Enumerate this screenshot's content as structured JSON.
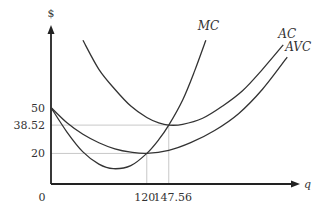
{
  "chart_data": {
    "type": "line",
    "title": "",
    "xlabel": "q",
    "ylabel": "$",
    "xlim": [
      0,
      312
    ],
    "ylim": [
      0,
      104
    ],
    "grid": false,
    "origin_label": "0",
    "x_ticks": [
      {
        "value": 120,
        "label": "120"
      },
      {
        "value": 147.56,
        "label": "147.56"
      }
    ],
    "y_ticks": [
      {
        "value": 50,
        "label": "50"
      },
      {
        "value": 38.52,
        "label": "38.52"
      },
      {
        "value": 20,
        "label": "20"
      }
    ],
    "guides": [
      {
        "x": 120,
        "y": 20
      },
      {
        "x": 147.56,
        "y": 38.52
      }
    ],
    "series": [
      {
        "name": "MC",
        "label": "MC",
        "points": [
          [
            0,
            50
          ],
          [
            20,
            34
          ],
          [
            40,
            21
          ],
          [
            60,
            13
          ],
          [
            78,
            10
          ],
          [
            100,
            12
          ],
          [
            120,
            20
          ],
          [
            135,
            29
          ],
          [
            147.56,
            38.52
          ],
          [
            165,
            55
          ],
          [
            180,
            74
          ],
          [
            194,
            94
          ]
        ]
      },
      {
        "name": "AC",
        "label": "AC",
        "points": [
          [
            40,
            94
          ],
          [
            60,
            75
          ],
          [
            80,
            62
          ],
          [
            100,
            51
          ],
          [
            120,
            43.5
          ],
          [
            135,
            40
          ],
          [
            147.56,
            38.52
          ],
          [
            165,
            39
          ],
          [
            190,
            43
          ],
          [
            215,
            51
          ],
          [
            240,
            61
          ],
          [
            265,
            75
          ],
          [
            291,
            91
          ]
        ]
      },
      {
        "name": "AVC",
        "label": "AVC",
        "points": [
          [
            0,
            50
          ],
          [
            20,
            40
          ],
          [
            40,
            32.5
          ],
          [
            60,
            27
          ],
          [
            80,
            23
          ],
          [
            100,
            20.8
          ],
          [
            120,
            20
          ],
          [
            147.56,
            22
          ],
          [
            175,
            27
          ],
          [
            205,
            35
          ],
          [
            235,
            46
          ],
          [
            265,
            62
          ],
          [
            296,
            83
          ]
        ]
      }
    ]
  }
}
